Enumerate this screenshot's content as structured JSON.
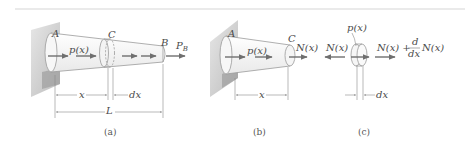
{
  "figure": {
    "panels": [
      {
        "id": "a",
        "caption": "(a)",
        "labels": {
          "end_a": "A",
          "section_c": "C",
          "end_b": "B",
          "distributed_load": "p(x)",
          "end_force": "P",
          "end_force_sub": "B",
          "dim_x": "x",
          "dim_dx": "dx",
          "dim_length": "L"
        }
      },
      {
        "id": "b",
        "caption": "(b)",
        "labels": {
          "end_a": "A",
          "section_c": "C",
          "distributed_load": "p(x)",
          "internal_force": "N(x)",
          "dim_x": "x"
        }
      },
      {
        "id": "c",
        "caption": "(c)",
        "labels": {
          "left_force": "N(x)",
          "distributed_load": "p(x)",
          "right_force_base": "N(x) +",
          "deriv_num": "d",
          "deriv_den": "dx",
          "right_force_tail": "N(x)",
          "dim_dx": "dx"
        }
      }
    ],
    "colors": {
      "shaft_fill": "#f4f4f4",
      "wall_light": "#d9d9d9",
      "wall_dark": "#a9a9a9",
      "arrow": "#6f6f6f",
      "rule": "#d6d6d6"
    }
  }
}
